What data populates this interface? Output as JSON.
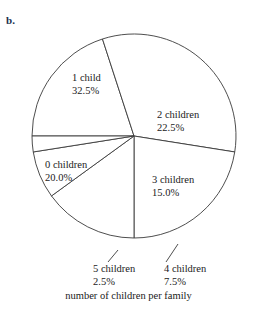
{
  "figure": {
    "item_label": "b.",
    "caption": "number of children per family"
  },
  "labels": {
    "zero_children": {
      "name": "0 children",
      "pct": "20.0%"
    },
    "one_child": {
      "name": "1 child",
      "pct": "32.5%"
    },
    "two_children": {
      "name": "2 children",
      "pct": "22.5%"
    },
    "three_children": {
      "name": "3 children",
      "pct": "15.0%"
    },
    "four_children": {
      "name": "4 children",
      "pct": "7.5%"
    },
    "five_children": {
      "name": "5 children",
      "pct": "2.5%"
    }
  },
  "chart_data": {
    "type": "pie",
    "title": "number of children per family",
    "xlabel": "",
    "ylabel": "",
    "categories": [
      "0 children",
      "1 child",
      "2 children",
      "3 children",
      "4 children",
      "5 children"
    ],
    "values": [
      20.0,
      32.5,
      22.5,
      15.0,
      7.5,
      2.5
    ],
    "value_labels": [
      "20.0%",
      "32.5%",
      "22.5%",
      "15.0%",
      "7.5%",
      "2.5%"
    ],
    "units": "percent",
    "total": 100.0,
    "start_angle_deg": 180,
    "direction": "clockwise",
    "slice_fill": "#ffffff",
    "slice_stroke": "#3a3a3a",
    "legend": "none",
    "grid": false,
    "label_placement": {
      "0 children": "inside",
      "1 child": "inside",
      "2 children": "inside",
      "3 children": "inside",
      "4 children": "outside-leader",
      "5 children": "outside-leader"
    }
  },
  "geometry": {
    "center_x": 134,
    "center_y": 136,
    "radius": 102
  }
}
